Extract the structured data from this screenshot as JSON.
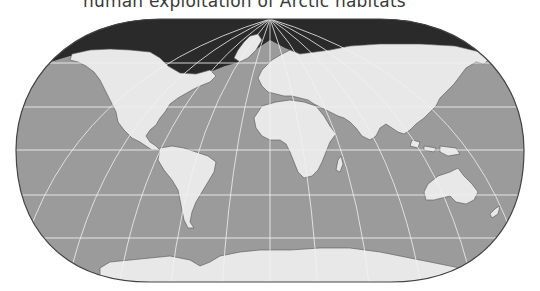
{
  "caption": "human exploitation of Arctic habitats",
  "map": {
    "projection": "pseudo-cylindrical world map (rounded)",
    "colors": {
      "ocean": "#9c9c9c",
      "land": "#e8e8e8",
      "arctic_ice": "#2b2b2b",
      "graticule": "#f2f2f2",
      "coastline": "#555555",
      "border": "#444444"
    },
    "regions": [
      {
        "name": "North America"
      },
      {
        "name": "Greenland"
      },
      {
        "name": "South America"
      },
      {
        "name": "Europe"
      },
      {
        "name": "Africa"
      },
      {
        "name": "Asia"
      },
      {
        "name": "Australia"
      },
      {
        "name": "Antarctica"
      },
      {
        "name": "Arctic Ocean (dark)"
      }
    ],
    "graticule": {
      "latitudes_y": [
        63,
        107,
        150,
        195,
        238
      ],
      "meridian_spacing_deg": 30,
      "pole": {
        "x": 270,
        "y": 19
      }
    }
  }
}
